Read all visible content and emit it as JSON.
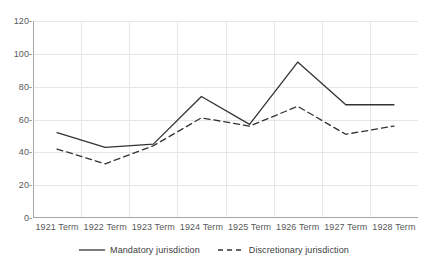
{
  "chart_data": {
    "type": "line",
    "title": "",
    "subtitle": "",
    "xlabel": "",
    "ylabel": "",
    "categories": [
      "1921 Term",
      "1922 Term",
      "1923 Term",
      "1924 Term",
      "1925 Term",
      "1926 Term",
      "1927 Term",
      "1928 Term"
    ],
    "series": [
      {
        "name": "Mandatory jurisdiction",
        "style": "solid",
        "color": "#333333",
        "values": [
          52,
          43,
          45,
          74,
          57,
          95,
          69,
          69
        ]
      },
      {
        "name": "Discretionary jurisdiction",
        "style": "dashed",
        "color": "#333333",
        "values": [
          42,
          33,
          44,
          61,
          56,
          68,
          51,
          56
        ]
      }
    ],
    "ylim": [
      0,
      120
    ],
    "yticks": [
      0,
      20,
      40,
      60,
      80,
      100,
      120
    ],
    "ytick_labels": [
      "0",
      "20",
      "40",
      "60",
      "80",
      "100",
      "120"
    ],
    "grid": {
      "horizontal": true,
      "vertical": true,
      "color": "#e6e6e6"
    },
    "legend": {
      "position": "bottom",
      "entries": [
        {
          "label": "Mandatory jurisdiction",
          "style": "solid"
        },
        {
          "label": "Discretionary jurisdiction",
          "style": "dashed"
        }
      ]
    },
    "axis_color": "#a6a6a6",
    "text_color": "#595959",
    "background": "#ffffff"
  }
}
